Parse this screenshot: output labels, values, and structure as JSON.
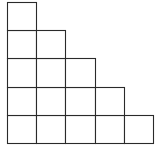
{
  "diagram": {
    "type": "staircase-grid",
    "columns": 5,
    "rows": 5,
    "column_heights": [
      5,
      4,
      3,
      2,
      1
    ],
    "total_cells": 15,
    "grid_x": [
      7,
      36,
      65,
      95,
      124,
      153
    ],
    "grid_y": [
      2,
      30,
      58,
      87,
      115,
      143
    ],
    "line_color": "#2a2a2a",
    "fill_color": "#ffffff"
  }
}
